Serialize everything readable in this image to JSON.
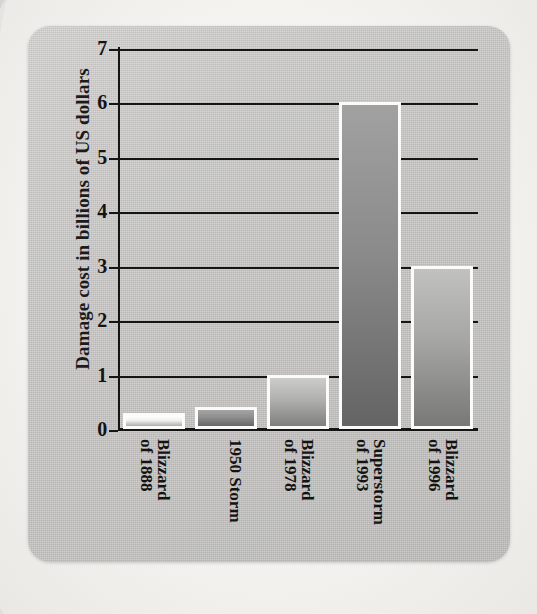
{
  "chart_data": {
    "type": "bar",
    "title": "",
    "xlabel": "",
    "ylabel": "Damage cost in billions of US dollars",
    "categories": [
      "Blizzard\nof 1888",
      "1950 Storm",
      "Blizzard\nof 1978",
      "Superstorm\nof 1993",
      "Blizzard\nof 1996"
    ],
    "values": [
      0.3,
      0.4,
      1.0,
      6.0,
      3.0
    ],
    "ylim": [
      0,
      7
    ],
    "yticks": [
      "0",
      "1",
      "2",
      "3",
      "4",
      "5",
      "6",
      "7"
    ],
    "grid": true,
    "legend": "none",
    "bar_colors": [
      "#f0f0ee",
      "#8e8e8e",
      "#b0b0af",
      "#8b8b8b",
      "#a6a6a5"
    ],
    "bar_border_color": "#fbfbfb",
    "axis_color": "#151515",
    "plot_background": "#c9c8c6"
  },
  "figure": {
    "card_background": "#c9c8c6",
    "page_background": "#f4f3f0"
  }
}
